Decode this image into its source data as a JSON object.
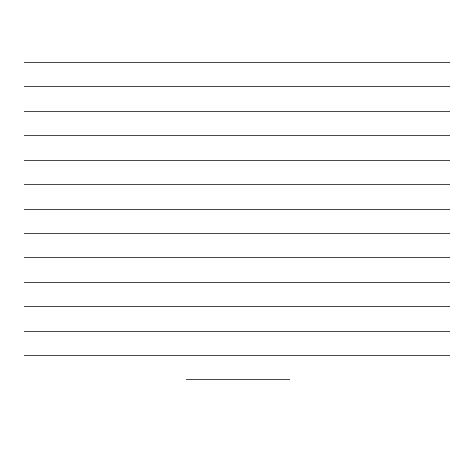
{
  "page": {
    "type": "lined-writing-sheet",
    "rule_color": "#4a4a4a",
    "background": "#ffffff",
    "ruled_lines": {
      "count": 13,
      "left": 24,
      "right": 450,
      "y_positions": [
        62,
        86,
        111,
        135,
        160,
        184,
        209,
        233,
        257,
        282,
        306,
        331,
        355
      ]
    },
    "signature_line": {
      "left": 186,
      "right": 290,
      "y": 379
    }
  }
}
